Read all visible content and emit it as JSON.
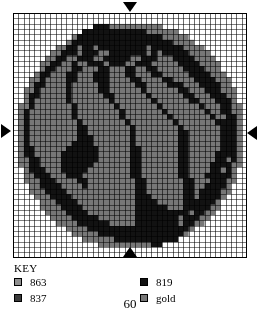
{
  "page_number": "60",
  "markers": {
    "top": "center-marker-top",
    "bottom": "center-marker-bottom",
    "left": "center-marker-left",
    "right": "center-marker-right"
  },
  "legend": {
    "title": "KEY",
    "entries": [
      {
        "label": "863",
        "color": "#8f8f8f",
        "column": "left"
      },
      {
        "label": "837",
        "color": "#3a3a3a",
        "column": "left"
      },
      {
        "label": "819",
        "color": "#121212",
        "column": "right"
      },
      {
        "label": "gold",
        "color": "#777777",
        "column": "right"
      }
    ]
  },
  "chart_data": {
    "type": "heatmap",
    "title": "",
    "xlabel": "",
    "ylabel": "",
    "grid": true,
    "legend_position": "bottom",
    "cell_size": 5.32,
    "cols": 44,
    "rows": 46,
    "palette": {
      "0": "#ffffff",
      "1": "#8f8f8f",
      "2": "#3a3a3a",
      "3": "#121212",
      "4": "#777777"
    },
    "palette_names": {
      "0": "blank",
      "1": "863",
      "2": "837",
      "3": "819",
      "4": "gold"
    },
    "grid_line_color": "#000000",
    "rows_rle": [
      [
        [
          0,
          44
        ]
      ],
      [
        [
          0,
          44
        ]
      ],
      [
        [
          0,
          15
        ],
        [
          3,
          3
        ],
        [
          0,
          26
        ]
      ],
      [
        [
          0,
          13
        ],
        [
          3,
          8
        ],
        [
          0,
          23
        ]
      ],
      [
        [
          0,
          12
        ],
        [
          3,
          11
        ],
        [
          0,
          21
        ]
      ],
      [
        [
          0,
          11
        ],
        [
          3,
          13
        ],
        [
          0,
          20
        ]
      ],
      [
        [
          0,
          10
        ],
        [
          3,
          2
        ],
        [
          4,
          1
        ],
        [
          3,
          2
        ],
        [
          4,
          1
        ],
        [
          3,
          9
        ],
        [
          0,
          19
        ]
      ],
      [
        [
          0,
          9
        ],
        [
          3,
          3
        ],
        [
          4,
          1
        ],
        [
          3,
          3
        ],
        [
          4,
          2
        ],
        [
          3,
          7
        ],
        [
          4,
          1
        ],
        [
          3,
          1
        ],
        [
          0,
          17
        ]
      ],
      [
        [
          0,
          8
        ],
        [
          3,
          2
        ],
        [
          4,
          2
        ],
        [
          3,
          3
        ],
        [
          4,
          2
        ],
        [
          3,
          5
        ],
        [
          4,
          2
        ],
        [
          3,
          3
        ],
        [
          0,
          17
        ]
      ],
      [
        [
          0,
          7
        ],
        [
          3,
          2
        ],
        [
          4,
          2
        ],
        [
          3,
          1
        ],
        [
          4,
          2
        ],
        [
          3,
          3
        ],
        [
          4,
          1
        ],
        [
          3,
          3
        ],
        [
          4,
          2
        ],
        [
          3,
          3
        ],
        [
          0,
          15
        ]
      ],
      [
        [
          0,
          6
        ],
        [
          3,
          2
        ],
        [
          4,
          3
        ],
        [
          3,
          2
        ],
        [
          4,
          3
        ],
        [
          3,
          2
        ],
        [
          4,
          3
        ],
        [
          3,
          2
        ],
        [
          4,
          2
        ],
        [
          3,
          2
        ],
        [
          0,
          15
        ]
      ],
      [
        [
          0,
          5
        ],
        [
          3,
          2
        ],
        [
          4,
          3
        ],
        [
          3,
          2
        ],
        [
          4,
          3
        ],
        [
          3,
          3
        ],
        [
          4,
          3
        ],
        [
          3,
          2
        ],
        [
          4,
          3
        ],
        [
          3,
          2
        ],
        [
          0,
          13
        ]
      ],
      [
        [
          0,
          5
        ],
        [
          3,
          1
        ],
        [
          4,
          4
        ],
        [
          3,
          2
        ],
        [
          4,
          3
        ],
        [
          3,
          3
        ],
        [
          4,
          4
        ],
        [
          3,
          2
        ],
        [
          4,
          4
        ],
        [
          3,
          2
        ],
        [
          0,
          11
        ]
      ],
      [
        [
          0,
          4
        ],
        [
          3,
          2
        ],
        [
          4,
          4
        ],
        [
          3,
          1
        ],
        [
          4,
          5
        ],
        [
          3,
          2
        ],
        [
          4,
          5
        ],
        [
          3,
          2
        ],
        [
          4,
          4
        ],
        [
          3,
          3
        ],
        [
          0,
          9
        ]
      ],
      [
        [
          0,
          4
        ],
        [
          3,
          1
        ],
        [
          4,
          5
        ],
        [
          3,
          1
        ],
        [
          4,
          5
        ],
        [
          3,
          2
        ],
        [
          4,
          6
        ],
        [
          3,
          1
        ],
        [
          4,
          6
        ],
        [
          3,
          2
        ],
        [
          0,
          8
        ]
      ],
      [
        [
          0,
          3
        ],
        [
          3,
          2
        ],
        [
          4,
          5
        ],
        [
          3,
          1
        ],
        [
          4,
          6
        ],
        [
          3,
          2
        ],
        [
          4,
          6
        ],
        [
          3,
          1
        ],
        [
          4,
          6
        ],
        [
          3,
          2
        ],
        [
          0,
          7
        ]
      ],
      [
        [
          0,
          3
        ],
        [
          3,
          1
        ],
        [
          4,
          6
        ],
        [
          3,
          1
        ],
        [
          4,
          7
        ],
        [
          3,
          1
        ],
        [
          4,
          7
        ],
        [
          3,
          1
        ],
        [
          4,
          6
        ],
        [
          3,
          2
        ],
        [
          0,
          6
        ]
      ],
      [
        [
          0,
          3
        ],
        [
          3,
          1
        ],
        [
          4,
          7
        ],
        [
          3,
          1
        ],
        [
          4,
          7
        ],
        [
          3,
          1
        ],
        [
          4,
          7
        ],
        [
          3,
          1
        ],
        [
          4,
          7
        ],
        [
          3,
          1
        ],
        [
          0,
          5
        ]
      ],
      [
        [
          0,
          2
        ],
        [
          3,
          1
        ],
        [
          4,
          8
        ],
        [
          3,
          1
        ],
        [
          4,
          8
        ],
        [
          3,
          1
        ],
        [
          4,
          7
        ],
        [
          3,
          1
        ],
        [
          4,
          7
        ],
        [
          3,
          1
        ],
        [
          0,
          5
        ]
      ],
      [
        [
          0,
          2
        ],
        [
          3,
          1
        ],
        [
          4,
          8
        ],
        [
          3,
          1
        ],
        [
          4,
          8
        ],
        [
          3,
          1
        ],
        [
          4,
          8
        ],
        [
          3,
          1
        ],
        [
          4,
          7
        ],
        [
          3,
          1
        ],
        [
          0,
          4
        ]
      ],
      [
        [
          0,
          2
        ],
        [
          3,
          1
        ],
        [
          4,
          9
        ],
        [
          3,
          1
        ],
        [
          4,
          8
        ],
        [
          3,
          1
        ],
        [
          4,
          8
        ],
        [
          3,
          1
        ],
        [
          4,
          7
        ],
        [
          3,
          2
        ],
        [
          0,
          2
        ]
      ],
      [
        [
          0,
          2
        ],
        [
          3,
          1
        ],
        [
          4,
          9
        ],
        [
          3,
          2
        ],
        [
          4,
          8
        ],
        [
          3,
          1
        ],
        [
          4,
          8
        ],
        [
          3,
          1
        ],
        [
          4,
          7
        ],
        [
          3,
          2
        ],
        [
          0,
          2
        ]
      ],
      [
        [
          0,
          2
        ],
        [
          3,
          1
        ],
        [
          4,
          9
        ],
        [
          3,
          2
        ],
        [
          4,
          8
        ],
        [
          3,
          1
        ],
        [
          4,
          8
        ],
        [
          3,
          2
        ],
        [
          4,
          6
        ],
        [
          3,
          2
        ],
        [
          0,
          2
        ]
      ],
      [
        [
          0,
          2
        ],
        [
          3,
          1
        ],
        [
          4,
          9
        ],
        [
          3,
          3
        ],
        [
          4,
          7
        ],
        [
          3,
          1
        ],
        [
          4,
          8
        ],
        [
          3,
          2
        ],
        [
          4,
          6
        ],
        [
          3,
          2
        ],
        [
          0,
          2
        ]
      ],
      [
        [
          0,
          2
        ],
        [
          3,
          1
        ],
        [
          4,
          8
        ],
        [
          3,
          4
        ],
        [
          4,
          7
        ],
        [
          3,
          1
        ],
        [
          4,
          8
        ],
        [
          3,
          2
        ],
        [
          4,
          6
        ],
        [
          3,
          2
        ],
        [
          0,
          2
        ]
      ],
      [
        [
          0,
          2
        ],
        [
          3,
          2
        ],
        [
          4,
          6
        ],
        [
          3,
          6
        ],
        [
          4,
          6
        ],
        [
          3,
          2
        ],
        [
          4,
          7
        ],
        [
          3,
          2
        ],
        [
          4,
          6
        ],
        [
          3,
          2
        ],
        [
          0,
          2
        ]
      ],
      [
        [
          0,
          2
        ],
        [
          3,
          2
        ],
        [
          4,
          5
        ],
        [
          3,
          7
        ],
        [
          4,
          6
        ],
        [
          3,
          2
        ],
        [
          4,
          7
        ],
        [
          3,
          2
        ],
        [
          4,
          5
        ],
        [
          3,
          3
        ],
        [
          0,
          2
        ]
      ],
      [
        [
          0,
          3
        ],
        [
          3,
          2
        ],
        [
          4,
          4
        ],
        [
          3,
          7
        ],
        [
          4,
          6
        ],
        [
          3,
          2
        ],
        [
          4,
          7
        ],
        [
          3,
          2
        ],
        [
          4,
          5
        ],
        [
          3,
          2
        ],
        [
          0,
          2
        ]
      ],
      [
        [
          0,
          3
        ],
        [
          3,
          2
        ],
        [
          4,
          4
        ],
        [
          3,
          6
        ],
        [
          4,
          7
        ],
        [
          3,
          2
        ],
        [
          4,
          7
        ],
        [
          3,
          2
        ],
        [
          4,
          4
        ],
        [
          3,
          3
        ],
        [
          0,
          2
        ]
      ],
      [
        [
          0,
          3
        ],
        [
          3,
          3
        ],
        [
          4,
          3
        ],
        [
          3,
          5
        ],
        [
          4,
          8
        ],
        [
          3,
          2
        ],
        [
          4,
          7
        ],
        [
          3,
          2
        ],
        [
          4,
          4
        ],
        [
          3,
          2
        ],
        [
          0,
          3
        ]
      ],
      [
        [
          0,
          4
        ],
        [
          3,
          3
        ],
        [
          4,
          3
        ],
        [
          3,
          3
        ],
        [
          4,
          9
        ],
        [
          3,
          2
        ],
        [
          4,
          7
        ],
        [
          3,
          2
        ],
        [
          4,
          3
        ],
        [
          3,
          3
        ],
        [
          0,
          3
        ]
      ],
      [
        [
          0,
          5
        ],
        [
          3,
          3
        ],
        [
          4,
          4
        ],
        [
          3,
          2
        ],
        [
          4,
          9
        ],
        [
          3,
          2
        ],
        [
          4,
          7
        ],
        [
          3,
          2
        ],
        [
          4,
          3
        ],
        [
          3,
          2
        ],
        [
          0,
          4
        ]
      ],
      [
        [
          0,
          5
        ],
        [
          3,
          4
        ],
        [
          4,
          4
        ],
        [
          3,
          1
        ],
        [
          4,
          9
        ],
        [
          3,
          2
        ],
        [
          4,
          7
        ],
        [
          3,
          2
        ],
        [
          4,
          2
        ],
        [
          3,
          2
        ],
        [
          0,
          5
        ]
      ],
      [
        [
          0,
          6
        ],
        [
          3,
          4
        ],
        [
          4,
          13
        ],
        [
          3,
          2
        ],
        [
          4,
          7
        ],
        [
          3,
          2
        ],
        [
          4,
          1
        ],
        [
          3,
          3
        ],
        [
          0,
          5
        ]
      ],
      [
        [
          0,
          7
        ],
        [
          3,
          4
        ],
        [
          4,
          12
        ],
        [
          3,
          3
        ],
        [
          4,
          6
        ],
        [
          3,
          2
        ],
        [
          4,
          1
        ],
        [
          3,
          2
        ],
        [
          0,
          7
        ]
      ],
      [
        [
          0,
          8
        ],
        [
          3,
          4
        ],
        [
          4,
          11
        ],
        [
          3,
          4
        ],
        [
          4,
          5
        ],
        [
          3,
          4
        ],
        [
          0,
          8
        ]
      ],
      [
        [
          0,
          9
        ],
        [
          3,
          4
        ],
        [
          4,
          10
        ],
        [
          3,
          6
        ],
        [
          4,
          3
        ],
        [
          3,
          3
        ],
        [
          0,
          9
        ]
      ],
      [
        [
          0,
          10
        ],
        [
          3,
          4
        ],
        [
          4,
          9
        ],
        [
          3,
          9
        ],
        [
          3,
          1
        ],
        [
          0,
          11
        ]
      ],
      [
        [
          0,
          11
        ],
        [
          3,
          5
        ],
        [
          4,
          7
        ],
        [
          3,
          8
        ],
        [
          0,
          13
        ]
      ],
      [
        [
          0,
          12
        ],
        [
          3,
          6
        ],
        [
          4,
          5
        ],
        [
          3,
          7
        ],
        [
          0,
          14
        ]
      ],
      [
        [
          0,
          14
        ],
        [
          3,
          15
        ],
        [
          0,
          15
        ]
      ],
      [
        [
          0,
          16
        ],
        [
          3,
          11
        ],
        [
          0,
          17
        ]
      ],
      [
        [
          0,
          19
        ],
        [
          3,
          5
        ],
        [
          0,
          20
        ]
      ],
      [
        [
          0,
          44
        ]
      ],
      [
        [
          0,
          44
        ]
      ],
      [
        [
          0,
          44
        ]
      ]
    ]
  }
}
